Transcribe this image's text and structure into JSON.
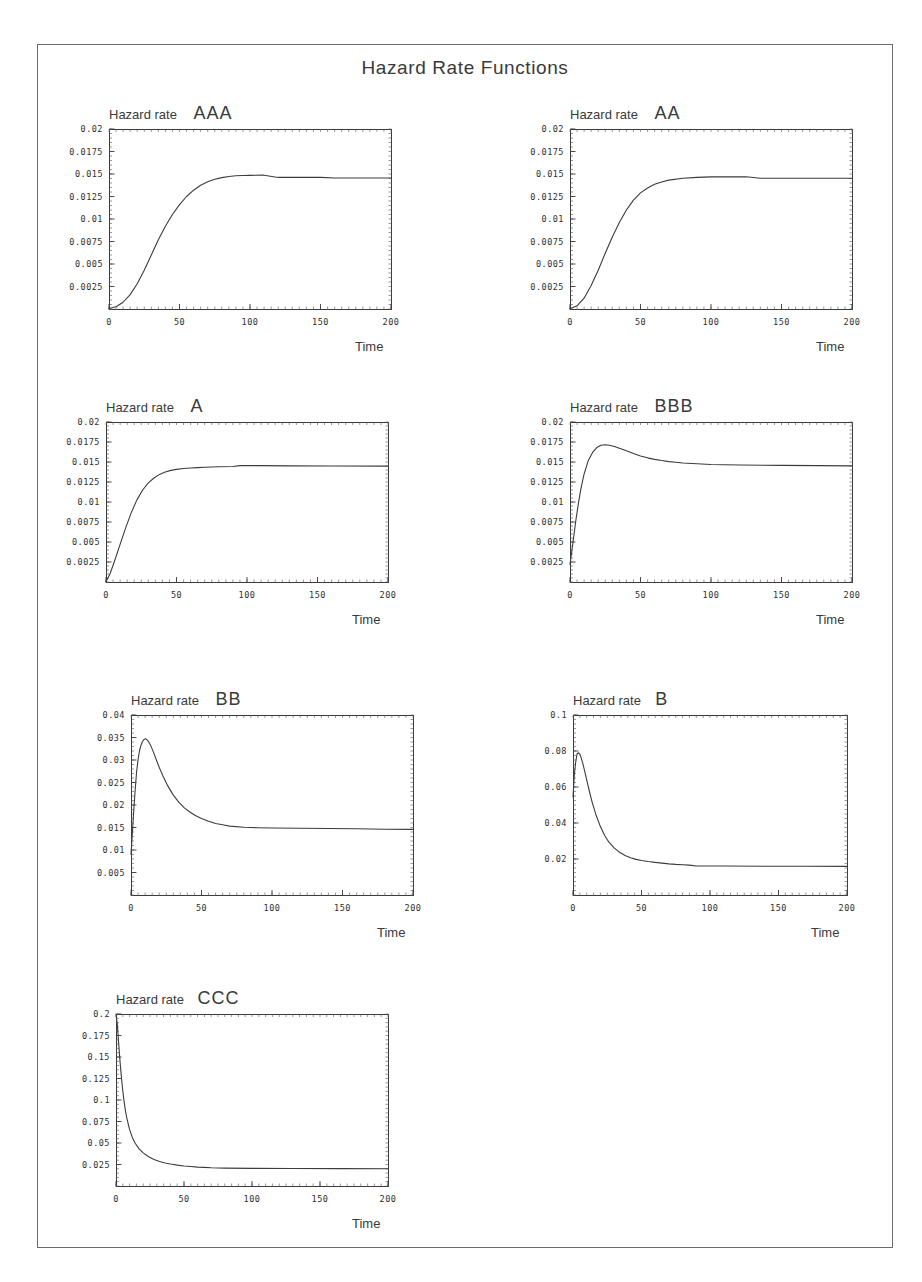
{
  "figure": {
    "title": "Hazard Rate Functions",
    "border_color": "#6b6b6b",
    "line_color": "#3c3c3c",
    "background": "#ffffff"
  },
  "chart_data": [
    {
      "type": "line",
      "title": "AAA",
      "xlabel": "Time",
      "ylabel": "Hazard rate",
      "xlim": [
        0,
        200
      ],
      "ylim": [
        0,
        0.02
      ],
      "xticks": [
        0,
        50,
        100,
        150,
        200
      ],
      "xticklabels": [
        "0",
        "50",
        "100",
        "150",
        "200"
      ],
      "yticks": [
        0.0025,
        0.005,
        0.0075,
        0.01,
        0.0125,
        0.015,
        0.0175,
        0.02
      ],
      "yticklabels": [
        "0.0025",
        "0.005",
        "0.0075",
        "0.01",
        "0.0125",
        "0.015",
        "0.0175",
        "0.02"
      ],
      "grid": false,
      "legend": "none",
      "x": [
        0,
        5,
        10,
        15,
        20,
        25,
        30,
        35,
        40,
        45,
        50,
        55,
        60,
        65,
        70,
        75,
        80,
        85,
        90,
        95,
        100,
        110,
        120,
        130,
        140,
        150,
        160,
        175,
        190,
        200
      ],
      "values": [
        5e-05,
        0.00025,
        0.00075,
        0.0016,
        0.0028,
        0.0043,
        0.006,
        0.0077,
        0.0092,
        0.0105,
        0.0116,
        0.0125,
        0.0132,
        0.01375,
        0.01415,
        0.01442,
        0.0146,
        0.01472,
        0.0148,
        0.01483,
        0.01485,
        0.01487,
        0.01462,
        0.01462,
        0.01462,
        0.01462,
        0.01455,
        0.01455,
        0.01455,
        0.01455
      ]
    },
    {
      "type": "line",
      "title": "AA",
      "xlabel": "Time",
      "ylabel": "Hazard rate",
      "xlim": [
        0,
        200
      ],
      "ylim": [
        0,
        0.02
      ],
      "xticks": [
        0,
        50,
        100,
        150,
        200
      ],
      "xticklabels": [
        "0",
        "50",
        "100",
        "150",
        "200"
      ],
      "yticks": [
        0.0025,
        0.005,
        0.0075,
        0.01,
        0.0125,
        0.015,
        0.0175,
        0.02
      ],
      "yticklabels": [
        "0.0025",
        "0.005",
        "0.0075",
        "0.01",
        "0.0125",
        "0.015",
        "0.0175",
        "0.02"
      ],
      "grid": false,
      "legend": "none",
      "x": [
        0,
        5,
        10,
        15,
        20,
        25,
        30,
        35,
        40,
        45,
        50,
        55,
        60,
        65,
        70,
        80,
        90,
        100,
        110,
        125,
        135,
        150,
        175,
        200
      ],
      "values": [
        2e-05,
        0.00035,
        0.0012,
        0.0026,
        0.0043,
        0.0062,
        0.008,
        0.0096,
        0.011,
        0.0121,
        0.0129,
        0.01345,
        0.01385,
        0.01412,
        0.01432,
        0.01452,
        0.01463,
        0.01468,
        0.01468,
        0.0147,
        0.01452,
        0.01452,
        0.01452,
        0.01452
      ]
    },
    {
      "type": "line",
      "title": "A",
      "xlabel": "Time",
      "ylabel": "Hazard rate",
      "xlim": [
        0,
        200
      ],
      "ylim": [
        0,
        0.02
      ],
      "xticks": [
        0,
        50,
        100,
        150,
        200
      ],
      "xticklabels": [
        "0",
        "50",
        "100",
        "150",
        "200"
      ],
      "yticks": [
        0.0025,
        0.005,
        0.0075,
        0.01,
        0.0125,
        0.015,
        0.0175,
        0.02
      ],
      "yticklabels": [
        "0.0025",
        "0.005",
        "0.0075",
        "0.01",
        "0.0125",
        "0.015",
        "0.0175",
        "0.02"
      ],
      "grid": false,
      "legend": "none",
      "x": [
        0,
        3,
        6,
        10,
        14,
        18,
        22,
        26,
        30,
        34,
        38,
        42,
        46,
        50,
        55,
        60,
        65,
        70,
        80,
        90,
        95,
        110,
        130,
        160,
        200
      ],
      "values": [
        2e-05,
        0.0011,
        0.0026,
        0.0047,
        0.0068,
        0.0087,
        0.0103,
        0.0115,
        0.0124,
        0.013,
        0.01345,
        0.01375,
        0.01395,
        0.01408,
        0.01418,
        0.01425,
        0.0143,
        0.01434,
        0.0144,
        0.01444,
        0.01455,
        0.01455,
        0.01452,
        0.0145,
        0.01448
      ]
    },
    {
      "type": "line",
      "title": "BBB",
      "xlabel": "Time",
      "ylabel": "Hazard rate",
      "xlim": [
        0,
        200
      ],
      "ylim": [
        0,
        0.02
      ],
      "xticks": [
        0,
        50,
        100,
        150,
        200
      ],
      "xticklabels": [
        "0",
        "50",
        "100",
        "150",
        "200"
      ],
      "yticks": [
        0.0025,
        0.005,
        0.0075,
        0.01,
        0.0125,
        0.015,
        0.0175,
        0.02
      ],
      "yticklabels": [
        "0.0025",
        "0.005",
        "0.0075",
        "0.01",
        "0.0125",
        "0.015",
        "0.0175",
        "0.02"
      ],
      "grid": false,
      "legend": "none",
      "x": [
        0,
        2,
        4,
        6,
        8,
        10,
        13,
        16,
        19,
        22,
        25,
        28,
        32,
        36,
        40,
        45,
        50,
        55,
        60,
        65,
        70,
        75,
        80,
        90,
        100,
        120,
        150,
        175,
        200
      ],
      "values": [
        0.0022,
        0.0048,
        0.0075,
        0.0099,
        0.0119,
        0.0135,
        0.0152,
        0.0162,
        0.0168,
        0.0171,
        0.01715,
        0.0171,
        0.0169,
        0.01665,
        0.0164,
        0.01605,
        0.01575,
        0.01552,
        0.01533,
        0.01518,
        0.01505,
        0.01496,
        0.01488,
        0.01478,
        0.01468,
        0.01462,
        0.01458,
        0.01455,
        0.01452
      ]
    },
    {
      "type": "line",
      "title": "BB",
      "xlabel": "Time",
      "ylabel": "Hazard rate",
      "xlim": [
        0,
        200
      ],
      "ylim": [
        0,
        0.04
      ],
      "xticks": [
        0,
        50,
        100,
        150,
        200
      ],
      "xticklabels": [
        "0",
        "50",
        "100",
        "150",
        "200"
      ],
      "yticks": [
        0.005,
        0.01,
        0.015,
        0.02,
        0.025,
        0.03,
        0.035,
        0.04
      ],
      "yticklabels": [
        "0.005",
        "0.01",
        "0.015",
        "0.02",
        "0.025",
        "0.03",
        "0.035",
        "0.04"
      ],
      "grid": false,
      "legend": "none",
      "x": [
        0,
        1,
        2,
        3,
        4,
        5,
        6,
        7,
        8,
        9,
        10,
        11,
        12,
        14,
        16,
        18,
        20,
        23,
        26,
        30,
        34,
        38,
        42,
        46,
        50,
        55,
        60,
        65,
        70,
        80,
        90,
        100,
        120,
        140,
        160,
        180,
        200
      ],
      "values": [
        0.009,
        0.014,
        0.019,
        0.0235,
        0.0275,
        0.03,
        0.032,
        0.0332,
        0.034,
        0.0345,
        0.0347,
        0.0346,
        0.0343,
        0.0332,
        0.0317,
        0.03,
        0.0284,
        0.0262,
        0.0243,
        0.0222,
        0.0206,
        0.0193,
        0.0184,
        0.0176,
        0.017,
        0.0164,
        0.0159,
        0.0156,
        0.0153,
        0.01505,
        0.01495,
        0.01488,
        0.01482,
        0.01478,
        0.01472,
        0.01462,
        0.01458
      ]
    },
    {
      "type": "line",
      "title": "B",
      "xlabel": "Time",
      "ylabel": "Hazard rate",
      "xlim": [
        0,
        200
      ],
      "ylim": [
        0,
        0.1
      ],
      "xticks": [
        0,
        50,
        100,
        150,
        200
      ],
      "xticklabels": [
        "0",
        "50",
        "100",
        "150",
        "200"
      ],
      "yticks": [
        0.02,
        0.04,
        0.06,
        0.08,
        0.1
      ],
      "yticklabels": [
        "0.02",
        "0.04",
        "0.06",
        "0.08",
        "0.1"
      ],
      "grid": false,
      "legend": "none",
      "x": [
        0,
        1,
        2,
        3,
        4,
        5,
        6,
        7,
        8,
        10,
        12,
        14,
        17,
        20,
        23,
        26,
        30,
        34,
        38,
        42,
        46,
        50,
        55,
        60,
        65,
        70,
        75,
        80,
        85,
        90,
        110,
        140,
        170,
        200
      ],
      "values": [
        0.0545,
        0.0672,
        0.074,
        0.0785,
        0.079,
        0.0782,
        0.0762,
        0.0735,
        0.0705,
        0.064,
        0.0575,
        0.0515,
        0.044,
        0.038,
        0.0332,
        0.0296,
        0.0262,
        0.0237,
        0.022,
        0.0207,
        0.0198,
        0.0192,
        0.0186,
        0.0181,
        0.0177,
        0.0173,
        0.017,
        0.0168,
        0.0166,
        0.0161,
        0.0161,
        0.016,
        0.016,
        0.0159
      ]
    },
    {
      "type": "line",
      "title": "CCC",
      "xlabel": "Time",
      "ylabel": "Hazard rate",
      "xlim": [
        0,
        200
      ],
      "ylim": [
        0,
        0.2
      ],
      "xticks": [
        0,
        50,
        100,
        150,
        200
      ],
      "xticklabels": [
        "0",
        "50",
        "100",
        "150",
        "200"
      ],
      "yticks": [
        0.025,
        0.05,
        0.075,
        0.1,
        0.125,
        0.15,
        0.175,
        0.2
      ],
      "yticklabels": [
        "0.025",
        "0.05",
        "0.075",
        "0.1",
        "0.125",
        "0.15",
        "0.175",
        "0.2"
      ],
      "grid": false,
      "legend": "none",
      "x": [
        0,
        1,
        2,
        3,
        4,
        5,
        6,
        7,
        8,
        10,
        12,
        14,
        17,
        20,
        24,
        28,
        32,
        36,
        40,
        45,
        50,
        55,
        60,
        65,
        70,
        80,
        100,
        130,
        165,
        200
      ],
      "values": [
        0.2,
        0.187,
        0.165,
        0.144,
        0.126,
        0.1105,
        0.0975,
        0.087,
        0.0785,
        0.0655,
        0.0565,
        0.05,
        0.0432,
        0.0385,
        0.034,
        0.0308,
        0.0285,
        0.0268,
        0.0255,
        0.0243,
        0.0233,
        0.0226,
        0.022,
        0.0216,
        0.0212,
        0.0208,
        0.0205,
        0.0203,
        0.0202,
        0.0201
      ]
    }
  ]
}
